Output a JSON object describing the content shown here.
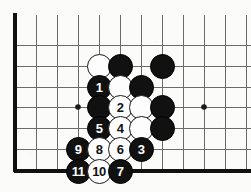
{
  "diagram": {
    "type": "go-board-corner-diagram",
    "board": {
      "line_color": "#5a5a5a",
      "edge_color": "#111111",
      "background_color": "#fbfbfa",
      "grid_spacing_px": 21,
      "origin_x_px": 15,
      "origin_y_px": 15,
      "edge_left_x_px": 15,
      "edge_bottom_y_px": 171,
      "vertical_lines_x": [
        15,
        36,
        57,
        78,
        99,
        120,
        141,
        162,
        183,
        204,
        225,
        246
      ],
      "horizontal_lines_y": [
        15,
        45,
        66,
        87,
        107,
        128,
        149,
        171
      ],
      "star_points": [
        {
          "x": 78,
          "y": 107
        },
        {
          "x": 204,
          "y": 107
        }
      ]
    },
    "stone_colors": {
      "black_fill": "#111111",
      "black_label": "#ffffff",
      "white_fill": "#fdfdfd",
      "white_label": "#111111",
      "white_outline": "#1a1a1a"
    },
    "stones": [
      {
        "id": "s01",
        "color": "white",
        "label": "",
        "x": 99,
        "y": 66
      },
      {
        "id": "s02",
        "color": "black",
        "label": "",
        "x": 120,
        "y": 66
      },
      {
        "id": "s03",
        "color": "black",
        "label": "",
        "x": 162,
        "y": 66
      },
      {
        "id": "s04",
        "color": "black",
        "label": "1",
        "x": 99,
        "y": 87
      },
      {
        "id": "s05",
        "color": "white",
        "label": "",
        "x": 120,
        "y": 87
      },
      {
        "id": "s06",
        "color": "black",
        "label": "",
        "x": 141,
        "y": 87
      },
      {
        "id": "s07",
        "color": "black",
        "label": "",
        "x": 99,
        "y": 107
      },
      {
        "id": "s08",
        "color": "white",
        "label": "2",
        "x": 120,
        "y": 107
      },
      {
        "id": "s09",
        "color": "white",
        "label": "",
        "x": 141,
        "y": 107
      },
      {
        "id": "s10",
        "color": "black",
        "label": "",
        "x": 162,
        "y": 107
      },
      {
        "id": "s11",
        "color": "black",
        "label": "5",
        "x": 99,
        "y": 128
      },
      {
        "id": "s12",
        "color": "white",
        "label": "4",
        "x": 120,
        "y": 128
      },
      {
        "id": "s13",
        "color": "white",
        "label": "",
        "x": 141,
        "y": 128
      },
      {
        "id": "s14",
        "color": "black",
        "label": "",
        "x": 162,
        "y": 128
      },
      {
        "id": "s15",
        "color": "black",
        "label": "9",
        "x": 78,
        "y": 149
      },
      {
        "id": "s16",
        "color": "white",
        "label": "8",
        "x": 99,
        "y": 149
      },
      {
        "id": "s17",
        "color": "white",
        "label": "6",
        "x": 120,
        "y": 149
      },
      {
        "id": "s18",
        "color": "black",
        "label": "3",
        "x": 141,
        "y": 149
      },
      {
        "id": "s19",
        "color": "black",
        "label": "11",
        "x": 78,
        "y": 171
      },
      {
        "id": "s20",
        "color": "white",
        "label": "10",
        "x": 99,
        "y": 171
      },
      {
        "id": "s21",
        "color": "black",
        "label": "7",
        "x": 120,
        "y": 171
      }
    ]
  }
}
